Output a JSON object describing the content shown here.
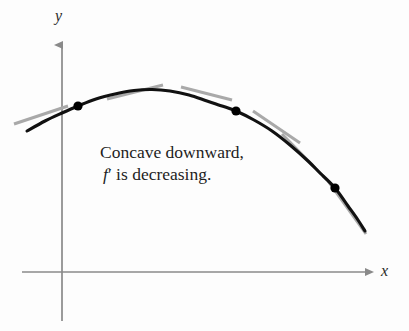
{
  "figure": {
    "background_color": "#fdfdfd"
  },
  "axes": {
    "x_label": "x",
    "y_label": "y",
    "axis_color": "#8a8a8a",
    "x_axis": {
      "y": 272,
      "x_start": 22,
      "x_end": 372
    },
    "y_axis": {
      "x": 62,
      "y_top": 38,
      "y_bottom": 321
    }
  },
  "annotation": {
    "line1": "Concave downward,",
    "line2_function": "f",
    "line2_prime": "′",
    "line2_rest": " is decreasing.",
    "full_text": "Concave downward, f′ is decreasing.",
    "color": "#1d1d1d"
  },
  "chart_data": {
    "type": "line",
    "xlabel": "x",
    "ylabel": "y",
    "grid": false,
    "legend": "none",
    "curve": {
      "name": "f",
      "color": "#111111",
      "stroke_width": 3.1,
      "description": "Smooth concave-down curve rising to a maximum then falling steeply",
      "points_px": [
        [
          27,
          131
        ],
        [
          45,
          121
        ],
        [
          62,
          113
        ],
        [
          78,
          106
        ],
        [
          96,
          99
        ],
        [
          115,
          94
        ],
        [
          134,
          90.5
        ],
        [
          152,
          89.5
        ],
        [
          170,
          91
        ],
        [
          189,
          95
        ],
        [
          207,
          101
        ],
        [
          222,
          106
        ],
        [
          236,
          111
        ],
        [
          254,
          120
        ],
        [
          272,
          131
        ],
        [
          290,
          145
        ],
        [
          308,
          161
        ],
        [
          320,
          173
        ],
        [
          335,
          188
        ],
        [
          348,
          206
        ],
        [
          358,
          220
        ],
        [
          365,
          231
        ]
      ]
    },
    "marked_points": [
      {
        "label": "point-1",
        "x_px": 78,
        "y_px": 106,
        "slope_sign": "positive"
      },
      {
        "label": "point-2",
        "x_px": 236,
        "y_px": 111,
        "slope_sign": "negative"
      },
      {
        "label": "point-3",
        "x_px": 335,
        "y_px": 188,
        "slope_sign": "steeply negative"
      }
    ],
    "point_style": {
      "color": "#000000",
      "radius_px": 4.6
    },
    "tangent_lines": {
      "color": "#a9a9a9",
      "stroke_width": 3.0,
      "segments": [
        {
          "name": "tangent-1",
          "x1": 14,
          "y1": 124,
          "x2": 68,
          "y2": 106
        },
        {
          "name": "tangent-2",
          "x1": 107,
          "y1": 99,
          "x2": 163,
          "y2": 85
        },
        {
          "name": "tangent-3",
          "x1": 181,
          "y1": 87,
          "x2": 232,
          "y2": 100
        },
        {
          "name": "tangent-4",
          "x1": 253,
          "y1": 111,
          "x2": 300,
          "y2": 143
        },
        {
          "name": "tangent-5",
          "x1": 282,
          "y1": 134,
          "x2": 324,
          "y2": 177
        },
        {
          "name": "tangent-6",
          "x1": 328,
          "y1": 181,
          "x2": 366,
          "y2": 234
        }
      ]
    },
    "ylim_px": [
      38,
      272
    ],
    "xlim_px": [
      22,
      372
    ]
  }
}
